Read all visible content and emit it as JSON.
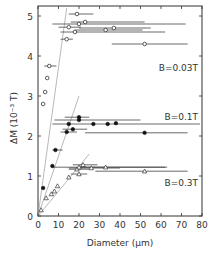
{
  "chart_data": {
    "type": "scatter",
    "title": "",
    "xlabel": "Diameter (μm)",
    "ylabel": "ΔM (10⁻³ T)",
    "xlim": [
      0,
      80
    ],
    "ylim": [
      0,
      5.2
    ],
    "x_ticks": [
      "0",
      "10",
      "20",
      "30",
      "40",
      "50",
      "60",
      "70",
      "80"
    ],
    "y_ticks": [
      "0",
      "1",
      "2",
      "3",
      "4",
      "5"
    ],
    "grid": false,
    "annotations": [
      "B=0.03T",
      "B=0.1T",
      "B=0.3T"
    ],
    "series": [
      {
        "name": "B=0.03T",
        "marker": "open-circle",
        "points": [
          {
            "x": 2.5,
            "y": 2.8
          },
          {
            "x": 3.5,
            "y": 3.1
          },
          {
            "x": 4.5,
            "y": 3.45
          },
          {
            "x": 5.5,
            "y": 3.75,
            "xerr": [
              3,
              9
            ]
          },
          {
            "x": 14,
            "y": 4.42,
            "xerr": [
              11,
              17
            ]
          },
          {
            "x": 18,
            "y": 4.6,
            "xerr": [
              11,
              62
            ]
          },
          {
            "x": 15,
            "y": 4.72,
            "xerr": [
              10,
              21
            ]
          },
          {
            "x": 20,
            "y": 4.8,
            "xerr": [
              7,
              72
            ]
          },
          {
            "x": 23,
            "y": 4.85,
            "xerr": [
              16,
              52
            ]
          },
          {
            "x": 19,
            "y": 5.05,
            "xerr": [
              15,
              27
            ]
          },
          {
            "x": 33,
            "y": 4.65,
            "xerr": [
              18,
              51
            ]
          },
          {
            "x": 37,
            "y": 4.7,
            "xerr": [
              20,
              55
            ]
          },
          {
            "x": 52,
            "y": 4.3,
            "xerr": [
              36,
              73
            ]
          }
        ]
      },
      {
        "name": "B=0.1T",
        "marker": "filled-circle",
        "points": [
          {
            "x": 2.5,
            "y": 0.7
          },
          {
            "x": 7,
            "y": 1.25
          },
          {
            "x": 8.5,
            "y": 1.65,
            "xerr": [
              7,
              12
            ]
          },
          {
            "x": 14,
            "y": 2.1,
            "xerr": [
              11,
              19
            ]
          },
          {
            "x": 17,
            "y": 2.17,
            "xerr": [
              12,
              24
            ]
          },
          {
            "x": 15,
            "y": 2.3,
            "xerr": [
              7,
              79
            ]
          },
          {
            "x": 27,
            "y": 2.3
          },
          {
            "x": 34,
            "y": 2.3
          },
          {
            "x": 38,
            "y": 2.32
          },
          {
            "x": 20,
            "y": 2.4,
            "xerr": [
              8,
              50
            ]
          },
          {
            "x": 20,
            "y": 2.47,
            "xerr": [
              13,
              25
            ]
          },
          {
            "x": 52,
            "y": 2.08,
            "xerr": [
              23,
              73
            ]
          }
        ]
      },
      {
        "name": "B=0.3T",
        "marker": "open-triangle",
        "points": [
          {
            "x": 1.5,
            "y": 0.15
          },
          {
            "x": 4,
            "y": 0.45
          },
          {
            "x": 6.5,
            "y": 0.55
          },
          {
            "x": 8,
            "y": 0.62
          },
          {
            "x": 9.5,
            "y": 0.75
          },
          {
            "x": 15,
            "y": 0.97
          },
          {
            "x": 20,
            "y": 1.05,
            "xerr": [
              16,
              24
            ]
          },
          {
            "x": 19,
            "y": 1.17,
            "xerr": [
              15,
              25
            ]
          },
          {
            "x": 20,
            "y": 1.22,
            "xerr": [
              7,
              62
            ]
          },
          {
            "x": 22,
            "y": 1.28,
            "xerr": [
              17,
              29
            ]
          },
          {
            "x": 26,
            "y": 1.2,
            "xerr": [
              15,
              40
            ]
          },
          {
            "x": 33,
            "y": 1.22,
            "xerr": [
              20,
              63
            ]
          },
          {
            "x": 52,
            "y": 1.12,
            "xerr": [
              28,
              73
            ]
          }
        ]
      }
    ],
    "reference_lines": [
      {
        "from": [
          0,
          0
        ],
        "to": [
          14,
          5.2
        ]
      },
      {
        "from": [
          0,
          0
        ],
        "to": [
          20,
          3.0
        ]
      },
      {
        "from": [
          0,
          0
        ],
        "to": [
          25,
          1.55
        ]
      }
    ]
  }
}
